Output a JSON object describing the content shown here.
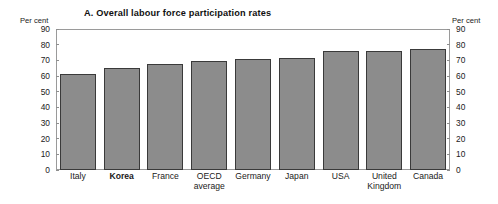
{
  "chart_data": {
    "type": "bar",
    "title": "A.  Overall labour force participation rates",
    "xlabel": "",
    "ylabel": "Per cent",
    "ylabel_right": "Per cent",
    "ylim": [
      0,
      90
    ],
    "ytick_step": 10,
    "yticks": [
      90,
      80,
      70,
      60,
      50,
      40,
      30,
      20,
      10,
      0
    ],
    "grid": false,
    "legend": "none",
    "categories": [
      "Italy",
      "Korea",
      "France",
      "OECD\naverage",
      "Germany",
      "Japan",
      "USA",
      "United\nKingdom",
      "Canada"
    ],
    "highlight_category": "Korea",
    "values": [
      61,
      65,
      67.5,
      69.5,
      71,
      71.8,
      75.8,
      76,
      77
    ],
    "bar_fill": "#8c8c8c",
    "bar_border": "#3a3a3a",
    "frame_color": "#9a9a9a"
  }
}
